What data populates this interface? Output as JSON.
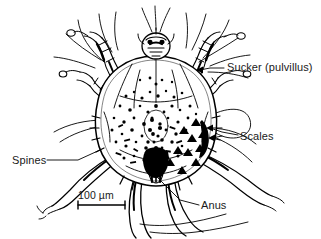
{
  "figure": {
    "background_color": "#ffffff",
    "ink_color": "#000000"
  },
  "labels": {
    "sucker": "Sucker (pulvillus)",
    "scales": "Scales",
    "spines": "Spines",
    "anus": "Anus"
  },
  "scale_bar": {
    "text": "100 µm",
    "length_px": 47
  }
}
